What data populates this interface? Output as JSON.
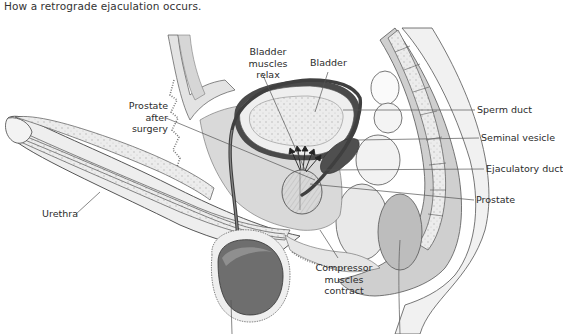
{
  "caption": "How a retrograde ejaculation occurs.",
  "labels": {
    "bladder_muscles": [
      "Bladder",
      "muscles",
      "relax"
    ],
    "bladder": "Bladder",
    "prostate_after_surgery": [
      "Prostate",
      "after",
      "surgery"
    ],
    "sperm_duct": "Sperm duct",
    "seminal_vesicle": "Seminal vesicle",
    "ejaculatory_duct": "Ejaculatory duct",
    "prostate": "Prostate",
    "urethra": "Urethra",
    "compressor_muscles": [
      "Compressor",
      "muscles",
      "contract"
    ]
  },
  "colors": {
    "tissue_light": "#e6e6e6",
    "tissue_mid": "#cfcfcf",
    "tissue_dark": "#8a8a8a",
    "duct_dark": "#555555",
    "outline": "#444444",
    "leader": "#555555"
  }
}
